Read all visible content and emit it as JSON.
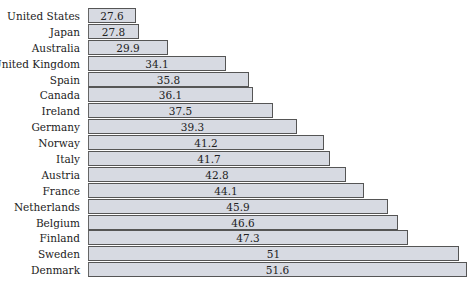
{
  "chart_data": {
    "type": "bar",
    "orientation": "horizontal",
    "title": "",
    "xlabel": "",
    "ylabel": "",
    "categories": [
      "United States",
      "Japan",
      "Australia",
      "United Kingdom",
      "Spain",
      "Canada",
      "Ireland",
      "Germany",
      "Norway",
      "Italy",
      "Austria",
      "France",
      "Netherlands",
      "Belgium",
      "Finland",
      "Sweden",
      "Denmark"
    ],
    "values": [
      27.6,
      27.8,
      29.9,
      34.1,
      35.8,
      36.1,
      37.5,
      39.3,
      41.2,
      41.7,
      42.8,
      44.1,
      45.9,
      46.6,
      47.3,
      51,
      51.6
    ],
    "value_labels": [
      "27.6",
      "27.8",
      "29.9",
      "34.1",
      "35.8",
      "36.1",
      "37.5",
      "39.3",
      "41.2",
      "41.7",
      "42.8",
      "44.1",
      "45.9",
      "46.6",
      "47.3",
      "51",
      "51.6"
    ],
    "grid": false,
    "legend": null,
    "bar_color": "#d7dae2",
    "bar_edge_color": "#555555"
  }
}
